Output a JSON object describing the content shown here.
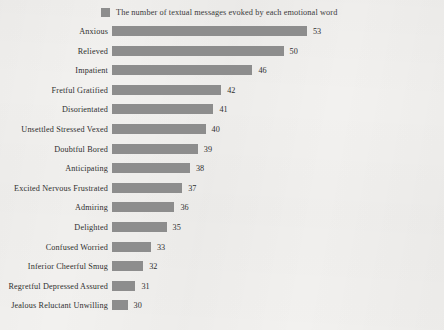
{
  "legend": {
    "swatch_color": "#8d8d8d",
    "label": "The number of textual messages evoked by each emotional word"
  },
  "style": {
    "bar_color": "#8d8d8d",
    "background_color": "#f2f1ef",
    "text_color": "#2f2f2f"
  },
  "chart_data": {
    "type": "bar",
    "orientation": "horizontal",
    "title": "",
    "subtitle": "",
    "xlabel": "",
    "ylabel": "",
    "grid": false,
    "legend_position": "top",
    "legend_entries": [
      "The number of textual messages evoked by each emotional word"
    ],
    "value_labels_shown": true,
    "axis_visible": false,
    "note": "Bottom category row and its value label are clipped by the image edge.",
    "xlim": [
      28,
      58
    ],
    "categories": [
      "Anxious",
      "Relieved",
      "Impatient",
      "Fretful  Gratified",
      "Disorientated",
      "Unsettled  Stressed  Vexed",
      "Doubtful  Bored",
      "Anticipating",
      "Excited  Nervous  Frustrated",
      "Admiring",
      "Delighted",
      "Confused  Worried",
      "Inferior  Cheerful  Smug",
      "Regretful  Depressed  Assured",
      "Jealous  Reluctant  Unwilling"
    ],
    "values": [
      53,
      50,
      46,
      42,
      41,
      40,
      39,
      38,
      37,
      36,
      35,
      33,
      32,
      31,
      30
    ],
    "series": [
      {
        "name": "The number of textual messages evoked by each emotional word",
        "values": [
          53,
          50,
          46,
          42,
          41,
          40,
          39,
          38,
          37,
          36,
          35,
          33,
          32,
          31,
          30
        ]
      }
    ]
  }
}
